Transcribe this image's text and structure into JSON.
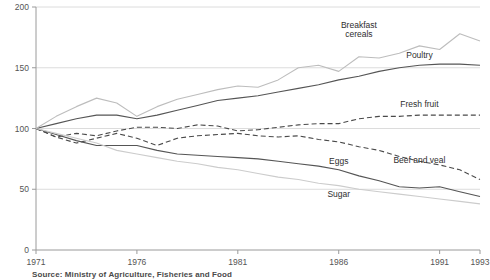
{
  "chart_data": {
    "type": "line",
    "title": "",
    "subtitle": "",
    "xlabel": "",
    "ylabel": "",
    "xlim": [
      1971,
      1993
    ],
    "ylim": [
      0,
      200
    ],
    "y_ticks": [
      0,
      50,
      100,
      150,
      200
    ],
    "x_ticks": [
      1971,
      1976,
      1981,
      1986,
      1991,
      1993
    ],
    "x_tick_labels": [
      "1971",
      "1976",
      "1981",
      "1986",
      "1991",
      "1993"
    ],
    "y_tick_labels": [
      "0",
      "50",
      "100",
      "150",
      "200"
    ],
    "grid": "horizontal",
    "legend": "inline-labels",
    "x": [
      1971,
      1972,
      1973,
      1974,
      1975,
      1976,
      1977,
      1978,
      1979,
      1980,
      1981,
      1982,
      1983,
      1984,
      1985,
      1986,
      1987,
      1988,
      1989,
      1990,
      1991,
      1992,
      1993
    ],
    "series": [
      {
        "name": "Breakfast cereals",
        "style": "solid",
        "color": "#555555",
        "label_x": 1987,
        "label_y": 183,
        "values": [
          100,
          104,
          108,
          111,
          111,
          108,
          111,
          115,
          119,
          123,
          125,
          127,
          130,
          133,
          136,
          140,
          143,
          147,
          150,
          152,
          153,
          153,
          152
        ]
      },
      {
        "name": "Poultry",
        "style": "solid",
        "color": "#bdbdbd",
        "label_x": 1990,
        "label_y": 158,
        "values": [
          100,
          110,
          118,
          125,
          121,
          110,
          118,
          124,
          128,
          132,
          135,
          134,
          140,
          150,
          152,
          147,
          159,
          158,
          162,
          168,
          165,
          178,
          172
        ]
      },
      {
        "name": "Fresh fruit",
        "style": "dashed",
        "color": "#4a4a4a",
        "label_x": 1990,
        "label_y": 118,
        "values": [
          100,
          93,
          96,
          94,
          98,
          101,
          101,
          100,
          103,
          102,
          98,
          99,
          101,
          103,
          104,
          104,
          108,
          110,
          110,
          111,
          111,
          111,
          111
        ]
      },
      {
        "name": "Beef and veal",
        "style": "dashed",
        "color": "#4a4a4a",
        "label_x": 1990,
        "label_y": 72,
        "values": [
          100,
          93,
          88,
          92,
          96,
          92,
          86,
          92,
          94,
          95,
          96,
          94,
          93,
          94,
          91,
          89,
          85,
          82,
          77,
          73,
          70,
          66,
          58
        ]
      },
      {
        "name": "Eggs",
        "style": "solid",
        "color": "#555555",
        "label_x": 1986,
        "label_y": 71,
        "values": [
          100,
          95,
          90,
          86,
          86,
          86,
          82,
          79,
          78,
          77,
          76,
          75,
          73,
          71,
          69,
          66,
          61,
          57,
          52,
          51,
          52,
          48,
          44
        ]
      },
      {
        "name": "Sugar",
        "style": "solid",
        "color": "#cccccc",
        "label_x": 1986,
        "label_y": 44,
        "values": [
          100,
          96,
          92,
          88,
          82,
          79,
          76,
          73,
          71,
          68,
          66,
          63,
          60,
          58,
          55,
          53,
          50,
          48,
          46,
          44,
          42,
          40,
          38
        ]
      }
    ]
  },
  "source": {
    "text": "Source: Ministry of Agriculture, Fisheries and Food"
  }
}
